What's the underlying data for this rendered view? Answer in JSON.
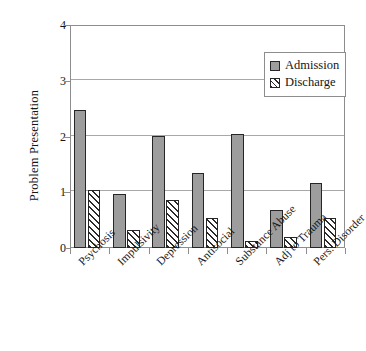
{
  "chart_data": {
    "type": "bar",
    "title": "",
    "xlabel": "",
    "ylabel": "Problem Presentation",
    "ylim": [
      0,
      4
    ],
    "yticks": [
      0,
      1,
      2,
      3,
      4
    ],
    "ytick_labels": [
      "0",
      "1",
      "2",
      "3",
      "4"
    ],
    "grid": true,
    "grid_axis": "y",
    "legend_position": "top-right",
    "categories": [
      "Psychosis",
      "Impulsivity",
      "Depression",
      "Antisocial",
      "Substance Abuse",
      "Adj to Trauma",
      "Pers. Disorder"
    ],
    "series": [
      {
        "name": "Admission",
        "fill": "solid-gray",
        "color": "#9d9d9d",
        "values": [
          2.47,
          0.97,
          2.01,
          1.34,
          2.04,
          0.69,
          1.17
        ]
      },
      {
        "name": "Discharge",
        "fill": "diagonal-hatch",
        "color": "#ffffff",
        "values": [
          1.04,
          0.33,
          0.86,
          0.53,
          0.13,
          0.2,
          0.54
        ]
      }
    ]
  },
  "legend": {
    "items": [
      {
        "label": "Admission"
      },
      {
        "label": "Discharge"
      }
    ]
  },
  "axes": {
    "y_title": "Problem Presentation"
  },
  "colors": {
    "admission_fill": "#9d9d9d",
    "hatch_stroke": "#2b2b2b",
    "axis": "#8d8d8d",
    "gridline": "#a8a8a8",
    "bar_border": "#262626",
    "text": "#161616",
    "background": "#ffffff"
  }
}
